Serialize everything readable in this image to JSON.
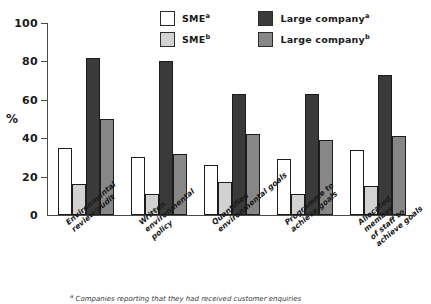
{
  "chart_data": {
    "type": "bar",
    "title": "",
    "xlabel": "",
    "ylabel": "%",
    "ylim": [
      0,
      100
    ],
    "yticks": [
      0,
      20,
      40,
      60,
      80,
      100
    ],
    "grid": false,
    "legend_position": "top-center",
    "categories": [
      "Environmental\nreview/audit",
      "Written\nenvironmental\npolicy",
      "Quantified\nenvironmental goals",
      "Programme to\nachieve goals",
      "Allocated member\nof staff to\nachieve goals"
    ],
    "series": [
      {
        "name": "SME",
        "superscript": "a",
        "color": "#ffffff",
        "values": [
          35,
          30,
          26,
          29,
          34
        ]
      },
      {
        "name": "SME",
        "superscript": "b",
        "color": "#d2d2d2",
        "values": [
          16,
          11,
          17,
          11,
          15
        ]
      },
      {
        "name": "Large company",
        "superscript": "a",
        "color": "#3a3a3a",
        "values": [
          82,
          80,
          63,
          63,
          73
        ]
      },
      {
        "name": "Large company",
        "superscript": "b",
        "color": "#878787",
        "values": [
          50,
          32,
          42,
          39,
          41
        ]
      }
    ]
  },
  "legend": {
    "entries": [
      {
        "label": "SME",
        "sup": "a",
        "color": "#ffffff"
      },
      {
        "label": "Large company",
        "sup": "a",
        "color": "#3a3a3a"
      },
      {
        "label": "SME",
        "sup": "b",
        "color": "#d2d2d2"
      },
      {
        "label": "Large company",
        "sup": "b",
        "color": "#878787"
      }
    ]
  },
  "axis": {
    "ylabel": "%",
    "ytick_labels": [
      "100",
      "80",
      "60",
      "40",
      "20",
      "0"
    ]
  },
  "footnote": {
    "marker": "a",
    "text": " Companies reporting that they had received customer enquiries"
  }
}
